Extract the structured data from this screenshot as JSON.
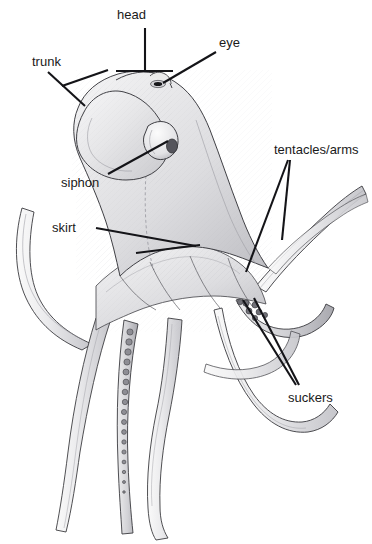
{
  "figure": {
    "kind": "anatomical-illustration",
    "background_color": "#ffffff",
    "ink_color": "#1a1a1a",
    "body_tone": "#e9e9ea",
    "shade_tone": "#b9b9bd",
    "dark_tone": "#6f6f74",
    "width": 372,
    "height": 544
  },
  "labels": {
    "head": "head",
    "eye": "eye",
    "trunk": "trunk",
    "tentacles_arms": "tentacles/arms",
    "siphon": "siphon",
    "skirt": "skirt",
    "suckers": "suckers"
  }
}
